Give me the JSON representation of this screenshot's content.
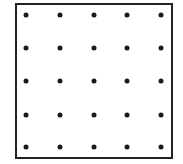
{
  "diagram": {
    "type": "dot-grid",
    "rows": 5,
    "columns": 5,
    "frame": {
      "left": 15,
      "top": 3,
      "right": 171,
      "bottom": 157,
      "color": "#222222"
    },
    "dot_color": "#1a1a1a",
    "column_x": [
      26,
      60,
      94,
      127,
      161
    ],
    "row_y": [
      15,
      48,
      81,
      115,
      147
    ]
  }
}
